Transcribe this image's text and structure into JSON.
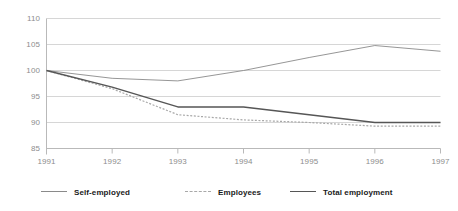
{
  "chart_data": {
    "type": "line",
    "title": "",
    "subtitle": "",
    "xlabel": "",
    "ylabel": "",
    "categories": [
      "1991",
      "1992",
      "1993",
      "1994",
      "1995",
      "1996",
      "1997"
    ],
    "ylim": [
      85,
      110
    ],
    "yticks": [
      85,
      90,
      95,
      100,
      105,
      110
    ],
    "ytick_labels": [
      "85",
      "90",
      "95",
      "100",
      "105",
      "110"
    ],
    "grid": true,
    "grid_axis": "y",
    "legend_position": "bottom",
    "series": [
      {
        "name": "Self-employed",
        "style": "solid-thin",
        "color": "#8a8a8a",
        "values": [
          100,
          98.5,
          98,
          100,
          102.5,
          104.8,
          103.7
        ]
      },
      {
        "name": "Employees",
        "style": "dashed",
        "color": "#a8a8a8",
        "values": [
          100,
          96.5,
          91.5,
          90.5,
          90,
          89.3,
          89.3
        ]
      },
      {
        "name": "Total employment",
        "style": "solid-thick",
        "color": "#565656",
        "values": [
          100,
          96.8,
          93,
          93,
          91.5,
          90,
          90
        ]
      }
    ]
  },
  "axes": {
    "axis_line_color": "#b9b9b9",
    "grid_color": "#d6d6d6",
    "tick_label_color": "#8d8d8d"
  },
  "legend": {
    "items": [
      {
        "label": "Self-employed",
        "style": "solid-thin"
      },
      {
        "label": "Employees",
        "style": "dashed"
      },
      {
        "label": "Total employment",
        "style": "solid-thick"
      }
    ]
  }
}
